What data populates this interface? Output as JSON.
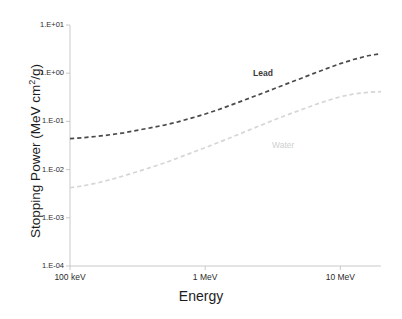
{
  "chart_data": {
    "type": "line",
    "title": "",
    "xlabel": "Energy",
    "ylabel": "Stopping Power (MeV cm2/g)",
    "ylabel_prefix": "Stopping  Power  (MeV  cm",
    "ylabel_superscript": "2",
    "ylabel_suffix": "/g)",
    "xscale": "log",
    "yscale": "log",
    "xlim": [
      0.1,
      20
    ],
    "ylim": [
      0.0001,
      10
    ],
    "grid": false,
    "legend_position": "inline-annotation",
    "xtick_labels": [
      "100 keV",
      "1 MeV",
      "10 MeV"
    ],
    "xtick_values": [
      0.1,
      1,
      10
    ],
    "ytick_labels": [
      "1.E+01",
      "1.E+00",
      "1.E-01",
      "1.E-02",
      "1.E-03",
      "1.E-04"
    ],
    "ytick_values": [
      10,
      1,
      0.1,
      0.01,
      0.001,
      0.0001
    ],
    "series": [
      {
        "name": "Lead",
        "color": "#4a4a4a",
        "style": "dashed",
        "x": [
          0.1,
          0.125,
          0.16,
          0.2,
          0.25,
          0.32,
          0.4,
          0.5,
          0.63,
          0.8,
          1.0,
          1.25,
          1.6,
          2.0,
          2.5,
          3.2,
          4.0,
          5.0,
          6.3,
          8.0,
          10.0,
          12.5,
          16.0,
          20.0
        ],
        "y": [
          0.044,
          0.046,
          0.049,
          0.053,
          0.058,
          0.066,
          0.074,
          0.084,
          0.098,
          0.118,
          0.142,
          0.175,
          0.225,
          0.285,
          0.36,
          0.47,
          0.6,
          0.76,
          0.98,
          1.26,
          1.58,
          1.92,
          2.3,
          2.55
        ],
        "label_point": {
          "x": 1.9,
          "y": 0.95
        }
      },
      {
        "name": "Water",
        "color": "#d6d6d6",
        "style": "dashed",
        "x": [
          0.1,
          0.125,
          0.16,
          0.2,
          0.25,
          0.32,
          0.4,
          0.5,
          0.63,
          0.8,
          1.0,
          1.25,
          1.6,
          2.0,
          2.5,
          3.2,
          4.0,
          5.0,
          6.3,
          8.0,
          10.0,
          12.5,
          16.0,
          20.0
        ],
        "y": [
          0.0042,
          0.0046,
          0.0053,
          0.0062,
          0.0074,
          0.0092,
          0.0112,
          0.0137,
          0.0175,
          0.0225,
          0.0285,
          0.0365,
          0.048,
          0.062,
          0.08,
          0.106,
          0.135,
          0.17,
          0.215,
          0.27,
          0.325,
          0.37,
          0.4,
          0.415
        ],
        "label_point": {
          "x": 2.8,
          "y": 0.042
        }
      }
    ]
  }
}
